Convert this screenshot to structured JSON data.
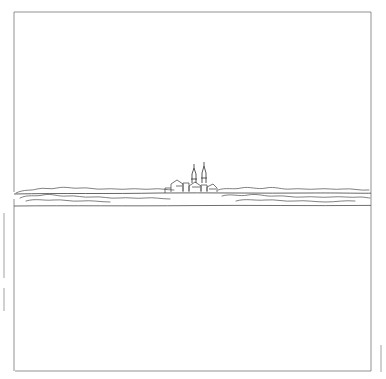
{
  "artwork": {
    "title": "Minimal line drawing of a distant town skyline across water",
    "medium": "pen-and-ink line drawing",
    "background_color": "#ffffff",
    "line_color": "#3a3a3a",
    "frame_color": "#6b6b6b",
    "labels": {
      "caption": "",
      "signature": ""
    },
    "elements": [
      {
        "name": "border-frame",
        "description": "thin rectangular ruled border inset from the edges"
      },
      {
        "name": "horizon-line",
        "description": "long nearly-straight horizontal line across the full width"
      },
      {
        "name": "water-line",
        "description": "second horizontal line slightly below the horizon"
      },
      {
        "name": "distant-town",
        "description": "cluster of small buildings near the centre"
      },
      {
        "name": "church-spires",
        "description": "two tall thin steeples rising above the town"
      },
      {
        "name": "treeline-left",
        "description": "low scalloped band of foliage left of the town"
      },
      {
        "name": "treeline-right",
        "description": "low scalloped band of foliage right of the town"
      },
      {
        "name": "left-margin-marks",
        "description": "two short vertical tick marks in the left margin"
      },
      {
        "name": "right-margin-mark",
        "description": "short vertical tick mark in the right margin"
      }
    ]
  }
}
